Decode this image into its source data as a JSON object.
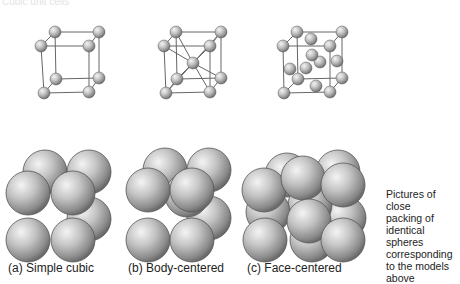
{
  "header": {
    "cropped_text": "Cubic unit cells"
  },
  "unit_cells": [
    {
      "id": "simple-cubic",
      "caption": "(a) Simple cubic",
      "lattice": {
        "front": [
          [
            41,
            46
          ],
          [
            89,
            46
          ],
          [
            89,
            92
          ],
          [
            44,
            93
          ]
        ],
        "back": [
          [
            55,
            32
          ],
          [
            99,
            32
          ],
          [
            99,
            78
          ],
          [
            56,
            79
          ]
        ],
        "extra": []
      },
      "packing": {
        "back": [
          [
            45,
            172
          ],
          [
            89,
            172
          ],
          [
            89,
            219
          ]
        ],
        "middle": [],
        "front": [
          [
            28,
            193
          ],
          [
            73,
            193
          ],
          [
            28,
            240
          ],
          [
            73,
            240
          ]
        ],
        "radius": 22
      }
    },
    {
      "id": "body-centered",
      "caption": "(b) Body-centered",
      "lattice": {
        "front": [
          [
            164,
            46
          ],
          [
            210,
            46
          ],
          [
            210,
            92
          ],
          [
            166,
            93
          ]
        ],
        "back": [
          [
            176,
            32
          ],
          [
            221,
            32
          ],
          [
            221,
            78
          ],
          [
            177,
            79
          ]
        ],
        "extra": [
          [
            193,
            63
          ]
        ]
      },
      "packing": {
        "back": [
          [
            165,
            170
          ],
          [
            209,
            170
          ],
          [
            209,
            218
          ]
        ],
        "middle": [
          [
            187,
            195
          ]
        ],
        "front": [
          [
            148,
            190
          ],
          [
            192,
            190
          ],
          [
            148,
            240
          ],
          [
            192,
            240
          ]
        ],
        "radius": 22
      }
    },
    {
      "id": "face-centered",
      "caption": "(c) Face-centered",
      "lattice": {
        "front": [
          [
            283,
            46
          ],
          [
            330,
            46
          ],
          [
            330,
            92
          ],
          [
            284,
            93
          ]
        ],
        "back": [
          [
            297,
            32
          ],
          [
            342,
            32
          ],
          [
            342,
            78
          ],
          [
            298,
            79
          ]
        ],
        "extra": [
          [
            311,
            39
          ],
          [
            320,
            62
          ],
          [
            306,
            68
          ],
          [
            337,
            61
          ],
          [
            290,
            69
          ],
          [
            316,
            86
          ],
          [
            312,
            55
          ]
        ]
      },
      "packing": {
        "back": [
          [
            287,
            175
          ],
          [
            338,
            172
          ],
          [
            344,
            218
          ]
        ],
        "middle": [
          [
            310,
            205
          ],
          [
            268,
            212
          ],
          [
            312,
            240
          ]
        ],
        "front": [
          [
            264,
            190
          ],
          [
            303,
            178
          ],
          [
            343,
            185
          ],
          [
            309,
            221
          ],
          [
            265,
            240
          ],
          [
            343,
            240
          ]
        ],
        "radius": 22
      }
    }
  ],
  "sidenote": {
    "lines": [
      "Pictures of close",
      "packing of",
      "identical spheres",
      "corresponding",
      "to the models",
      "above"
    ]
  },
  "colors": {
    "sphere_light": "#f2f2f2",
    "sphere_mid": "#b8b8b8",
    "sphere_dark": "#6f6f6f",
    "edge": "#555555",
    "line": "#666666",
    "text": "#222222"
  }
}
